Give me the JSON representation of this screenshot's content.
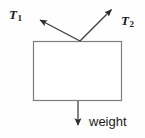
{
  "figure": {
    "type": "free-body-force-diagram",
    "background_color": "#fefefe",
    "body": {
      "shape": "rectangle",
      "stroke_color": "#7d7d7d",
      "fill_color": "#ffffff",
      "x": 33,
      "y": 41,
      "width": 89,
      "height": 60
    },
    "application_point": {
      "x": 80,
      "y": 41
    },
    "forces": [
      {
        "name": "tension-left",
        "label": "T",
        "subscript": "1",
        "direction": "up-left",
        "from": {
          "x": 80,
          "y": 41
        },
        "to": {
          "x": 38,
          "y": 19
        },
        "stroke_color": "#3b3b3b"
      },
      {
        "name": "tension-right",
        "label": "T",
        "subscript": "2",
        "direction": "up-right",
        "from": {
          "x": 80,
          "y": 41
        },
        "to": {
          "x": 113,
          "y": 8
        },
        "stroke_color": "#3b3b3b"
      },
      {
        "name": "weight",
        "label": "weight",
        "subscript": "",
        "direction": "down",
        "from": {
          "x": 78,
          "y": 101
        },
        "to": {
          "x": 78,
          "y": 127
        },
        "stroke_color": "#3b3b3b"
      }
    ]
  }
}
